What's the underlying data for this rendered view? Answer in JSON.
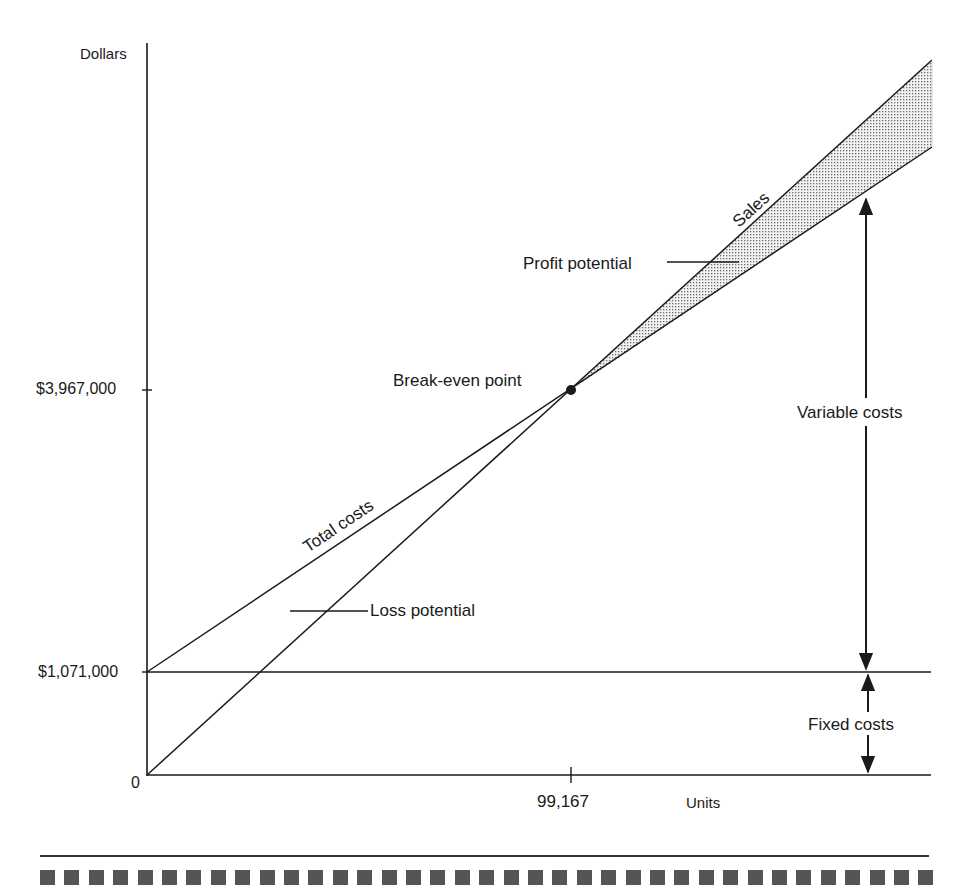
{
  "chart_data": {
    "type": "line",
    "xlabel": "Units",
    "ylabel": "Dollars",
    "x_ticks": [
      {
        "value": 0,
        "label": "0"
      },
      {
        "value": 99167,
        "label": "99,167"
      }
    ],
    "y_ticks": [
      {
        "value": 0,
        "label": "0"
      },
      {
        "value": 1071000,
        "label": "$1,071,000"
      },
      {
        "value": 3967000,
        "label": "$3,967,000"
      }
    ],
    "series": [
      {
        "name": "Sales",
        "points": [
          [
            0,
            0
          ],
          [
            99167,
            3967000
          ],
          [
            184200,
            7370000
          ]
        ]
      },
      {
        "name": "Total costs",
        "points": [
          [
            0,
            1071000
          ],
          [
            99167,
            3967000
          ],
          [
            184200,
            6474000
          ]
        ]
      },
      {
        "name": "Fixed costs",
        "points": [
          [
            0,
            1071000
          ],
          [
            184200,
            1071000
          ]
        ]
      }
    ],
    "break_even": {
      "units": 99167,
      "dollars": 3967000,
      "label": "Break-even point"
    },
    "annotations": [
      {
        "text": "Profit potential",
        "region": "between Sales and Total costs, right of break-even (shaded)"
      },
      {
        "text": "Loss potential",
        "region": "between Total costs and Sales, left of break-even"
      },
      {
        "text": "Variable costs",
        "type": "double-arrow",
        "from": "Fixed costs line",
        "to": "Total costs line"
      },
      {
        "text": "Fixed costs",
        "type": "double-arrow",
        "from": "x-axis",
        "to": "Fixed costs line"
      }
    ],
    "grid": false,
    "legend": "none (inline labels)"
  },
  "labels": {
    "y_axis": "Dollars",
    "x_axis": "Units",
    "y_tick_high": "$3,967,000",
    "y_tick_fixed": "$1,071,000",
    "origin": "0",
    "x_tick_be": "99,167",
    "sales": "Sales",
    "total_costs": "Total costs",
    "profit_potential": "Profit potential",
    "loss_potential": "Loss potential",
    "break_even": "Break-even point",
    "variable_costs": "Variable costs",
    "fixed_costs": "Fixed costs"
  },
  "footer": {
    "square_count": 37
  }
}
